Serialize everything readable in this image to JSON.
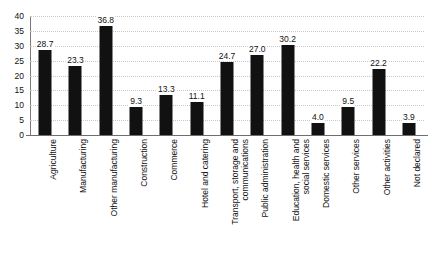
{
  "chart_data": {
    "type": "bar",
    "title": "",
    "subtitle": "",
    "xlabel": "",
    "ylabel": "",
    "ylim": [
      0,
      40
    ],
    "ytick_step": 5,
    "yticks": [
      "40",
      "35",
      "30",
      "25",
      "20",
      "15",
      "10",
      "5",
      "0"
    ],
    "ytick_values": [
      40,
      35,
      30,
      25,
      20,
      15,
      10,
      5,
      0
    ],
    "grid": true,
    "grid_axis": "y",
    "grid_style": "dotted",
    "legend": false,
    "legend_position": "none",
    "bar_color": "#111111",
    "grid_color": "#c8c8c8",
    "axis_color": "#6e6e6e",
    "text_color": "#111111",
    "background_color": "#ffffff",
    "value_label_format": "one-decimal",
    "categories": [
      "Agriculture",
      "Manufacturing",
      "Other manufacturing",
      "Construction",
      "Commerce",
      "Hotel and catering",
      "Transport, storage and\ncommunications",
      "Public administration",
      "Education, health and\nsocial services",
      "Domestic services",
      "Other services",
      "Other activities",
      "Not declared"
    ],
    "values": [
      28.7,
      23.3,
      36.8,
      9.3,
      13.3,
      11.1,
      24.7,
      27.0,
      30.2,
      4.0,
      9.5,
      22.2,
      3.9
    ],
    "value_labels": [
      "28.7",
      "23.3",
      "36.8",
      "9.3",
      "13.3",
      "11.1",
      "24.7",
      "27.0",
      "30.2",
      "4.0",
      "9.5",
      "22.2",
      "3.9"
    ]
  }
}
